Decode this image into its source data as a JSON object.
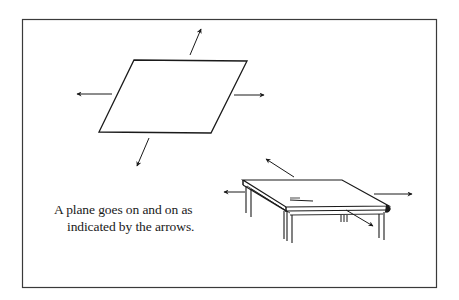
{
  "figure": {
    "caption_lines": [
      "A plane goes on and on as",
      "indicated by the arrows."
    ],
    "elements": {
      "frame": "rectangular border",
      "parallelogram": "abstract plane with four outward arrows",
      "table": "table top illustration with four outward arrows"
    },
    "colors": {
      "ink": "#1a1a1a",
      "frame": "#3a3a3a",
      "background": "#ffffff"
    }
  }
}
